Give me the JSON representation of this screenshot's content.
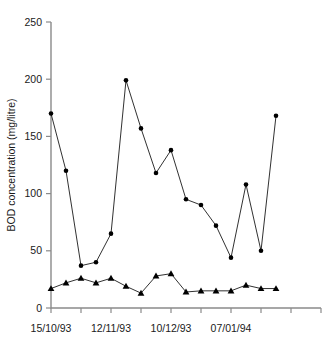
{
  "chart_data": {
    "type": "line",
    "title": "",
    "xlabel": "",
    "ylabel": "BOD concentration (mg/litre)",
    "ylim": [
      0,
      250
    ],
    "yticks": [
      0,
      50,
      100,
      150,
      200,
      250
    ],
    "ytick_labels": [
      "0",
      "50",
      "100",
      "150",
      "200",
      "250"
    ],
    "grid": false,
    "legend": "none",
    "x_index": [
      0,
      1,
      2,
      3,
      4,
      5,
      6,
      7,
      8,
      9,
      10,
      11,
      12,
      13,
      14,
      15,
      16,
      17,
      18
    ],
    "xtick_positions": [
      0,
      4,
      8,
      12,
      16
    ],
    "xtick_labels": [
      "15/10/93",
      "12/11/93",
      "10/12/93",
      "07/01/94",
      ""
    ],
    "series": [
      {
        "name": "upper-series",
        "marker": "circle",
        "values": [
          170,
          120,
          37,
          40,
          65,
          199,
          157,
          118,
          138,
          95,
          90,
          72,
          44,
          108,
          50,
          168
        ],
        "x_index": [
          0,
          1,
          2,
          3,
          4,
          5,
          6,
          7,
          8,
          9,
          10,
          11,
          12,
          13,
          14,
          15
        ]
      },
      {
        "name": "lower-series",
        "marker": "triangle",
        "values": [
          17,
          22,
          26,
          22,
          26,
          19,
          13,
          28,
          30,
          14,
          15,
          15,
          15,
          20,
          17,
          17
        ],
        "x_index": [
          0,
          1,
          2,
          3,
          4,
          5,
          6,
          7,
          8,
          9,
          10,
          11,
          12,
          13,
          14,
          15
        ]
      }
    ]
  },
  "axis": {
    "y_axis_title": "BOD concentration (mg/litre)"
  }
}
